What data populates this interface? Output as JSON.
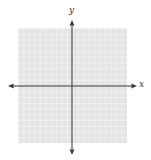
{
  "figure": {
    "type": "blank coordinate plane",
    "x_axis_label": "x",
    "y_axis_label": "y",
    "grid": {
      "cells_x": 20,
      "cells_y": 20,
      "background_color": "#e6e6e6",
      "line_color": "#ffffff"
    },
    "axis_color": "#333333"
  }
}
